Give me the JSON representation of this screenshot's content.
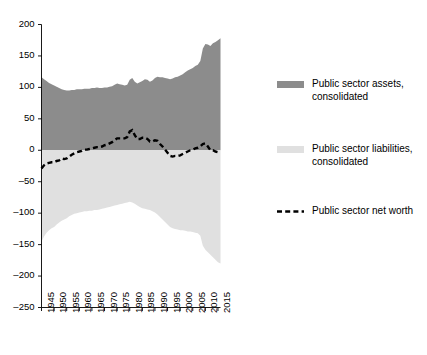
{
  "chart_data": {
    "type": "area",
    "title": "",
    "xlabel": "",
    "ylabel": "",
    "ylim": [
      -250,
      200
    ],
    "xlim": [
      1945,
      2016
    ],
    "grid": false,
    "legend_position": "right",
    "yticks": [
      200,
      150,
      100,
      50,
      0,
      -50,
      -100,
      -150,
      -200,
      -250
    ],
    "ytick_labels": [
      "200",
      "150",
      "100",
      "50",
      "0",
      "–50",
      "–100",
      "–150",
      "–200",
      "–250"
    ],
    "xticks": [
      1945,
      1950,
      1955,
      1960,
      1965,
      1970,
      1975,
      1980,
      1985,
      1990,
      1995,
      2000,
      2005,
      2010,
      2015
    ],
    "xtick_labels": [
      "1945",
      "1950",
      "1955",
      "1960",
      "1965",
      "1970",
      "1975",
      "1980",
      "1985",
      "1990",
      "1995",
      "2000",
      "2005",
      "2010",
      "2015"
    ],
    "colors": {
      "assets": "#8c8c8c",
      "liabilities": "#e0e0e0",
      "net_worth": "#000000",
      "axis": "#000000"
    },
    "series": [
      {
        "name": "Public sector assets, consolidated",
        "key": "assets",
        "type": "area",
        "color": "#8c8c8c",
        "x": [
          1945,
          1946,
          1947,
          1948,
          1949,
          1950,
          1951,
          1952,
          1953,
          1954,
          1955,
          1956,
          1957,
          1958,
          1959,
          1960,
          1961,
          1962,
          1963,
          1964,
          1965,
          1966,
          1967,
          1968,
          1969,
          1970,
          1971,
          1972,
          1973,
          1974,
          1975,
          1976,
          1977,
          1978,
          1979,
          1980,
          1981,
          1982,
          1983,
          1984,
          1985,
          1986,
          1987,
          1988,
          1989,
          1990,
          1991,
          1992,
          1993,
          1994,
          1995,
          1996,
          1997,
          1998,
          1999,
          2000,
          2001,
          2002,
          2003,
          2004,
          2005,
          2006,
          2007,
          2008,
          2009,
          2010,
          2011,
          2012,
          2013,
          2014,
          2015,
          2016
        ],
        "values": [
          116,
          113,
          110,
          107,
          105,
          103,
          101,
          99,
          97,
          96,
          95,
          95,
          96,
          96,
          97,
          97,
          97,
          98,
          98,
          98,
          99,
          99,
          100,
          99,
          99,
          100,
          100,
          101,
          102,
          104,
          106,
          105,
          104,
          103,
          104,
          112,
          115,
          109,
          106,
          108,
          110,
          113,
          112,
          109,
          111,
          115,
          117,
          116,
          116,
          115,
          114,
          113,
          114,
          116,
          117,
          119,
          121,
          124,
          127,
          129,
          131,
          134,
          136,
          142,
          162,
          169,
          168,
          166,
          170,
          172,
          175,
          178
        ]
      },
      {
        "name": "Public sector liabilities, consolidated",
        "key": "liabilities",
        "type": "area",
        "color": "#e0e0e0",
        "x": [
          1945,
          1946,
          1947,
          1948,
          1949,
          1950,
          1951,
          1952,
          1953,
          1954,
          1955,
          1956,
          1957,
          1958,
          1959,
          1960,
          1961,
          1962,
          1963,
          1964,
          1965,
          1966,
          1967,
          1968,
          1969,
          1970,
          1971,
          1972,
          1973,
          1974,
          1975,
          1976,
          1977,
          1978,
          1979,
          1980,
          1981,
          1982,
          1983,
          1984,
          1985,
          1986,
          1987,
          1988,
          1989,
          1990,
          1991,
          1992,
          1993,
          1994,
          1995,
          1996,
          1997,
          1998,
          1999,
          2000,
          2001,
          2002,
          2003,
          2004,
          2005,
          2006,
          2007,
          2008,
          2009,
          2010,
          2011,
          2012,
          2013,
          2014,
          2015,
          2016
        ],
        "values": [
          -145,
          -137,
          -131,
          -127,
          -124,
          -122,
          -118,
          -115,
          -112,
          -110,
          -108,
          -105,
          -103,
          -101,
          -100,
          -99,
          -98,
          -97,
          -97,
          -96,
          -96,
          -95,
          -95,
          -94,
          -93,
          -92,
          -91,
          -90,
          -89,
          -88,
          -87,
          -86,
          -85,
          -84,
          -83,
          -82,
          -83,
          -85,
          -88,
          -90,
          -92,
          -93,
          -94,
          -95,
          -97,
          -99,
          -102,
          -106,
          -110,
          -114,
          -118,
          -122,
          -124,
          -125,
          -126,
          -127,
          -127,
          -128,
          -129,
          -129,
          -130,
          -131,
          -132,
          -136,
          -152,
          -158,
          -162,
          -166,
          -170,
          -174,
          -178,
          -180
        ]
      },
      {
        "name": "Public sector net worth",
        "key": "net_worth",
        "type": "line",
        "style": "dashed",
        "color": "#000000",
        "x": [
          1945,
          1946,
          1947,
          1948,
          1949,
          1950,
          1951,
          1952,
          1953,
          1954,
          1955,
          1956,
          1957,
          1958,
          1959,
          1960,
          1961,
          1962,
          1963,
          1964,
          1965,
          1966,
          1967,
          1968,
          1969,
          1970,
          1971,
          1972,
          1973,
          1974,
          1975,
          1976,
          1977,
          1978,
          1979,
          1980,
          1981,
          1982,
          1983,
          1984,
          1985,
          1986,
          1987,
          1988,
          1989,
          1990,
          1991,
          1992,
          1993,
          1994,
          1995,
          1996,
          1997,
          1998,
          1999,
          2000,
          2001,
          2002,
          2003,
          2004,
          2005,
          2006,
          2007,
          2008,
          2009,
          2010,
          2011,
          2012,
          2013,
          2014,
          2015,
          2016
        ],
        "values": [
          -29,
          -24,
          -21,
          -20,
          -19,
          -19,
          -17,
          -16,
          -13,
          -14,
          -13,
          -10,
          -7,
          -5,
          -3,
          -2,
          -1,
          1,
          1,
          2,
          3,
          4,
          5,
          5,
          6,
          8,
          9,
          11,
          13,
          16,
          19,
          19,
          19,
          19,
          21,
          30,
          32,
          24,
          18,
          18,
          20,
          20,
          18,
          14,
          14,
          16,
          15,
          10,
          6,
          1,
          -4,
          -9,
          -10,
          -9,
          -9,
          -8,
          -6,
          -4,
          -2,
          0,
          1,
          3,
          4,
          6,
          10,
          11,
          6,
          0,
          0,
          -2,
          -3,
          -2
        ]
      }
    ]
  },
  "legend": {
    "items": [
      {
        "label": "Public sector assets,\nconsolidated",
        "swatch": "assets",
        "color": "#8c8c8c",
        "style": "fill"
      },
      {
        "label": "Public sector liabilities,\nconsolidated",
        "swatch": "liabilities",
        "color": "#e0e0e0",
        "style": "fill"
      },
      {
        "label": "Public sector net worth",
        "swatch": "net-worth",
        "color": "#000000",
        "style": "dashed"
      }
    ]
  }
}
